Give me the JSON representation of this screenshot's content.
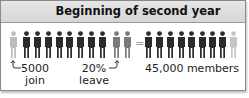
{
  "title": "Beginning of second year",
  "colors": {
    "header_bg": "#dcdcdc",
    "member": "#2b2b2b",
    "joining": "#b8b8b8",
    "leaving": "#7a7a7a",
    "new_member": "#c4c4c4"
  },
  "left_group": {
    "joining_count": 1,
    "member_count": 8,
    "leaving_count": 2
  },
  "right_group": {
    "member_count": 8,
    "new_member_count": 1
  },
  "operator": "=",
  "labels": {
    "join_value": "5000",
    "join_text": "join",
    "leave_value": "20%",
    "leave_text": "leave",
    "result": "45,000 members"
  }
}
